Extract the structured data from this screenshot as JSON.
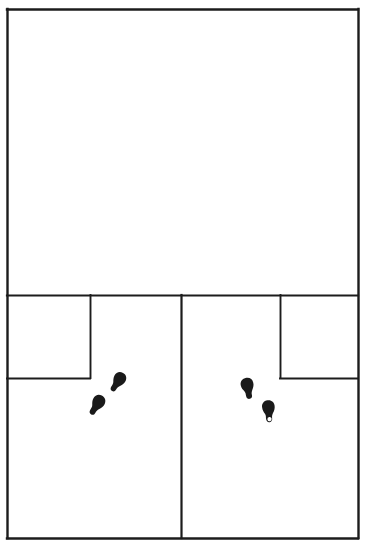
{
  "diagram": {
    "type": "floor-plan",
    "background_color": "#ffffff",
    "line_color": "#1c1c1c",
    "marker_color": "#1a1a1a",
    "canvas": {
      "width": 365,
      "height": 553
    },
    "outer_boundary": {
      "x": 7,
      "y": 9,
      "width": 351,
      "height": 529
    },
    "rooms": [
      {
        "id": "room-upper-main",
        "label": "",
        "x": 7,
        "y": 9,
        "width": 351,
        "height": 286
      },
      {
        "id": "room-lower-left-small",
        "label": "",
        "x": 7,
        "y": 295,
        "width": 83,
        "height": 83
      },
      {
        "id": "room-lower-left-main",
        "label": "",
        "x": 7,
        "y": 295,
        "width": 174,
        "height": 243
      },
      {
        "id": "room-lower-right-main",
        "label": "",
        "x": 181,
        "y": 295,
        "width": 177,
        "height": 243
      },
      {
        "id": "room-lower-right-small",
        "label": "",
        "x": 280,
        "y": 295,
        "width": 78,
        "height": 83
      }
    ],
    "walls": [
      {
        "id": "wall-outer-top",
        "x1": 7,
        "y1": 9,
        "x2": 358,
        "y2": 9
      },
      {
        "id": "wall-outer-right",
        "x1": 358,
        "y1": 9,
        "x2": 358,
        "y2": 538
      },
      {
        "id": "wall-outer-bottom",
        "x1": 7,
        "y1": 538,
        "x2": 358,
        "y2": 538
      },
      {
        "id": "wall-outer-left",
        "x1": 7,
        "y1": 9,
        "x2": 7,
        "y2": 538
      },
      {
        "id": "wall-horizontal-divider",
        "x1": 7,
        "y1": 295,
        "x2": 358,
        "y2": 295
      },
      {
        "id": "wall-vertical-center",
        "x1": 181,
        "y1": 295,
        "x2": 181,
        "y2": 538
      },
      {
        "id": "wall-left-small-room-right",
        "x1": 90,
        "y1": 295,
        "x2": 90,
        "y2": 378
      },
      {
        "id": "wall-left-small-room-bottom",
        "x1": 7,
        "y1": 378,
        "x2": 90,
        "y2": 378
      },
      {
        "id": "wall-right-small-room-left",
        "x1": 280,
        "y1": 295,
        "x2": 280,
        "y2": 378
      },
      {
        "id": "wall-right-small-room-bottom",
        "x1": 280,
        "y1": 378,
        "x2": 358,
        "y2": 378
      }
    ],
    "footprints": [
      {
        "id": "footprint-left-upper",
        "side": "right",
        "cx": 118,
        "cy": 382,
        "rotation": 28,
        "has_heel_hole": false
      },
      {
        "id": "footprint-left-lower",
        "side": "left",
        "cx": 97,
        "cy": 405,
        "rotation": 28,
        "has_heel_hole": false
      },
      {
        "id": "footprint-right-upper",
        "side": "left",
        "cx": 248,
        "cy": 388,
        "rotation": -14,
        "has_heel_hole": false
      },
      {
        "id": "footprint-right-lower",
        "side": "right",
        "cx": 269,
        "cy": 411,
        "rotation": -8,
        "has_heel_hole": true
      }
    ]
  }
}
